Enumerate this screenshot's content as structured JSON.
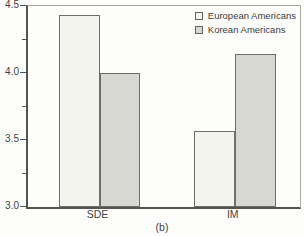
{
  "figure": {
    "caption": "(b)"
  },
  "chart_data": {
    "type": "bar",
    "categories": [
      "SDE",
      "IM"
    ],
    "series": [
      {
        "name": "European Americans",
        "values": [
          4.43,
          3.57
        ],
        "fill": "#f4f4ee"
      },
      {
        "name": "Korean Americans",
        "values": [
          4.0,
          4.14
        ],
        "fill": "#d8d8d2"
      }
    ],
    "title": "",
    "xlabel": "",
    "ylabel": "",
    "ylim": [
      3.0,
      4.5
    ],
    "yticks": [
      4.5,
      4.0,
      3.5,
      3.0
    ],
    "ytick_labels": [
      "4.5",
      "4.0",
      "3.5",
      "3.0"
    ],
    "minor_yticks": [
      4.25,
      3.75,
      3.25
    ],
    "grid": false,
    "legend_position": "top-right"
  },
  "colors": {
    "bar_fill_european": "#f4f4ee",
    "bar_fill_korean": "#d8d8d2",
    "bar_border": "#6f6f68",
    "axis": "#56534d",
    "box_light": "#a8a8a2",
    "text": "#3d3b37",
    "background": "#fdfdfb"
  }
}
